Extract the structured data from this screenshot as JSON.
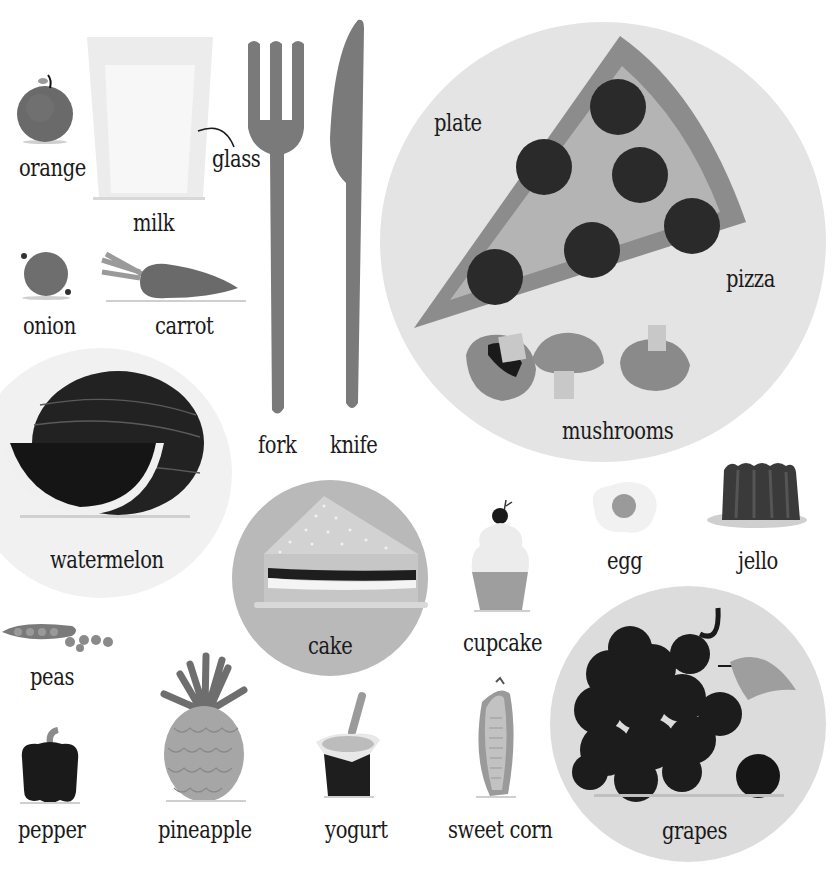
{
  "page": {
    "background": "#ffffff",
    "text_color": "#1a1a1a"
  },
  "items": {
    "orange": {
      "label": "orange",
      "icon": "orange-icon"
    },
    "milk": {
      "label": "milk",
      "icon": "glass-of-milk-icon"
    },
    "glass": {
      "label": "glass",
      "icon": "glass-pointer-icon"
    },
    "fork": {
      "label": "fork",
      "icon": "fork-icon"
    },
    "knife": {
      "label": "knife",
      "icon": "knife-icon"
    },
    "plate": {
      "label": "plate",
      "icon": "plate-icon"
    },
    "pizza": {
      "label": "pizza",
      "icon": "pizza-slice-icon"
    },
    "mushrooms": {
      "label": "mushrooms",
      "icon": "mushrooms-icon"
    },
    "onion": {
      "label": "onion",
      "icon": "onion-icon"
    },
    "carrot": {
      "label": "carrot",
      "icon": "carrot-icon"
    },
    "watermelon": {
      "label": "watermelon",
      "icon": "watermelon-icon"
    },
    "cake": {
      "label": "cake",
      "icon": "cake-slice-icon"
    },
    "cupcake": {
      "label": "cupcake",
      "icon": "cupcake-icon"
    },
    "egg": {
      "label": "egg",
      "icon": "fried-egg-icon"
    },
    "jello": {
      "label": "jello",
      "icon": "jello-icon"
    },
    "peas": {
      "label": "peas",
      "icon": "peas-icon"
    },
    "pepper": {
      "label": "pepper",
      "icon": "bell-pepper-icon"
    },
    "pineapple": {
      "label": "pineapple",
      "icon": "pineapple-icon"
    },
    "yogurt": {
      "label": "yogurt",
      "icon": "yogurt-icon"
    },
    "sweet_corn": {
      "label": "sweet corn",
      "icon": "corn-icon"
    },
    "grapes": {
      "label": "grapes",
      "icon": "grapes-icon"
    }
  },
  "colors": {
    "plate": "#e4e4e4",
    "cake_plate": "#b9b9b9",
    "grapes_plate": "#dcdcdc",
    "watermelon_plate": "#f1f1f1",
    "cutlery": "#7a7a7a",
    "pizza_crust": "#8c8c8c",
    "pizza_cheese": "#b4b4b4",
    "pepperoni": "#2a2a2a",
    "dark_fill": "#1e1e1e",
    "mid_fill": "#6e6e6e"
  }
}
